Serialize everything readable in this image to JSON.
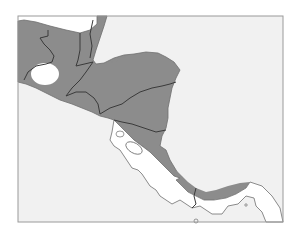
{
  "map": {
    "title": "",
    "region": "Central America",
    "legend": [],
    "colors": {
      "page_background": "#ffffff",
      "sea": "#f1f1f1",
      "shaded_land": "#8c8c8c",
      "unshaded_land": "#ffffff",
      "border": "#3a3a3a",
      "coastline": "#6f6f6f",
      "frame": "#9a9a9a"
    },
    "shaded_areas": [
      "northern Central America (Guatemala, Belize, Honduras, El Salvador, Nicaragua)",
      "Caribbean coastal strip of Costa Rica",
      "Caribbean coastal strip of western Panama"
    ],
    "unshaded_areas": [
      "Yucatan (northern Mexico strip)",
      "interior pocket in Guatemala",
      "Pacific Costa Rica",
      "Pacific Panama"
    ]
  }
}
